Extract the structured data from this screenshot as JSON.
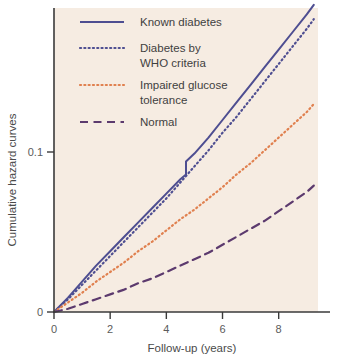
{
  "figure": {
    "background_color": "#ffffff",
    "plot_background_color": "#f6ece2",
    "axis_color": "#3a3a3a"
  },
  "chart_data": {
    "type": "line",
    "title": "",
    "xlabel": "Follow-up (years)",
    "ylabel": "Cumulative hazard curves",
    "xlim": [
      0,
      9.4
    ],
    "ylim": [
      0,
      0.19
    ],
    "xticks": [
      0,
      2,
      4,
      6,
      8
    ],
    "xticklabels": [
      "0",
      "2",
      "4",
      "6",
      "8"
    ],
    "yticks": [
      0,
      0.1
    ],
    "yticklabels": [
      "0",
      "0.1"
    ],
    "grid": false,
    "legend_position": "upper left",
    "series": [
      {
        "name": "Known diabetes",
        "color": "#4e4e91",
        "linestyle": "solid",
        "x": [
          0,
          0.5,
          1.0,
          1.5,
          2.0,
          2.5,
          3.0,
          3.5,
          4.0,
          4.5,
          4.7,
          4.7,
          5.0,
          5.5,
          6.0,
          6.5,
          7.0,
          7.5,
          8.0,
          8.5,
          9.0,
          9.25
        ],
        "y": [
          0.0,
          0.009,
          0.019,
          0.029,
          0.038,
          0.047,
          0.056,
          0.065,
          0.074,
          0.083,
          0.086,
          0.094,
          0.099,
          0.109,
          0.12,
          0.131,
          0.142,
          0.153,
          0.164,
          0.175,
          0.186,
          0.192
        ]
      },
      {
        "name": "Diabetes by WHO criteria",
        "color": "#4e4e91",
        "linestyle": "dotted",
        "x": [
          0,
          0.5,
          1.0,
          1.5,
          2.0,
          2.5,
          3.0,
          3.5,
          4.0,
          4.5,
          5.0,
          5.5,
          6.0,
          6.5,
          7.0,
          7.5,
          8.0,
          8.5,
          9.0,
          9.25
        ],
        "y": [
          0.0,
          0.008,
          0.017,
          0.026,
          0.035,
          0.044,
          0.053,
          0.062,
          0.071,
          0.081,
          0.091,
          0.101,
          0.112,
          0.122,
          0.133,
          0.144,
          0.155,
          0.166,
          0.177,
          0.183
        ]
      },
      {
        "name": "Impaired glucose tolerance",
        "color": "#e0804f",
        "linestyle": "dotted",
        "x": [
          0,
          0.5,
          1.0,
          1.5,
          2.0,
          2.5,
          3.0,
          3.5,
          4.0,
          4.5,
          5.0,
          5.5,
          6.0,
          6.5,
          7.0,
          7.5,
          8.0,
          8.5,
          9.0,
          9.25
        ],
        "y": [
          0.0,
          0.006,
          0.012,
          0.019,
          0.025,
          0.031,
          0.038,
          0.044,
          0.051,
          0.058,
          0.064,
          0.071,
          0.078,
          0.086,
          0.093,
          0.101,
          0.109,
          0.117,
          0.125,
          0.13
        ]
      },
      {
        "name": "Normal",
        "color": "#5c3a6e",
        "linestyle": "dashed",
        "x": [
          0,
          0.5,
          1.0,
          1.5,
          2.0,
          2.5,
          3.0,
          3.5,
          4.0,
          4.5,
          5.0,
          5.5,
          6.0,
          6.5,
          7.0,
          7.5,
          8.0,
          8.5,
          9.0,
          9.25
        ],
        "y": [
          0.0,
          0.002,
          0.005,
          0.008,
          0.011,
          0.014,
          0.018,
          0.021,
          0.025,
          0.029,
          0.033,
          0.037,
          0.042,
          0.047,
          0.052,
          0.057,
          0.063,
          0.069,
          0.075,
          0.079
        ]
      }
    ]
  },
  "legend": {
    "items": [
      {
        "label": "Known diabetes",
        "color": "#4e4e91",
        "style": "solid"
      },
      {
        "label": "Diabetes by",
        "label2": "WHO criteria",
        "color": "#4e4e91",
        "style": "dotted"
      },
      {
        "label": "Impaired glucose",
        "label2": "tolerance",
        "color": "#e0804f",
        "style": "dotted"
      },
      {
        "label": "Normal",
        "color": "#5c3a6e",
        "style": "dashed"
      }
    ]
  }
}
